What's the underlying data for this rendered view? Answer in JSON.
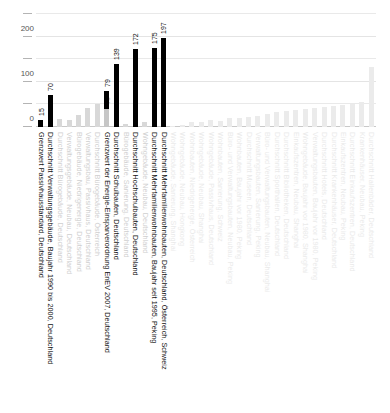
{
  "chart_data": {
    "type": "bar",
    "title": "",
    "subtitle": "",
    "xlabel": "",
    "ylabel": "",
    "ylim": [
      0,
      250
    ],
    "grid": true,
    "legend": "none",
    "y_ticks": [
      {
        "value": 0,
        "label": "0",
        "major": true
      },
      {
        "value": 50,
        "label": "",
        "major": false
      },
      {
        "value": 100,
        "label": "100",
        "major": true
      },
      {
        "value": 150,
        "label": "",
        "major": false
      },
      {
        "value": 200,
        "label": "200",
        "major": true
      },
      {
        "value": 250,
        "label": "",
        "major": false
      }
    ],
    "categories": [
      "Grenzwert Passivhausstandard, Deutschland",
      "Durchschnitt Verwaltungsgebäude, Baujahr 1990 bis 2000, Deutschland",
      "Durchschnitt Bürogebäude, Deutschland",
      "Verwaltungsgebäude, Neubau, Deutschland",
      "Bürogebäude, Niedrigenergie, Deutschland",
      "Verwaltungsbau, Passivhaus, Deutschland",
      "Durchschnitt Bürogebäude, Österreich",
      "Grenzwert der Energie-Einsparverordnung EnEV 2007, Deutschland",
      "Durchschnitt Schulbauten, Deutschland",
      "Bürogebäude, Sanierung, Deutschland",
      "Durchschnitt Hochschulbauten, Deutschland",
      "Wohngebäude, Neubau, Deutschland",
      "Durchschnitt Mehrfamilienwohnbauten, Baujahr seit 1995, Peking",
      "Durchschnitt Mehrfamilienwohnbauten, Deutschland, Österreich, Schweiz",
      "Wohngebäude, Sanierung, Shanghai",
      "Wohngebäude, Neubau, Hongkong",
      "Wohnbauten, Niedrigenergie, Österreich",
      "Wohngebäude, Neubau, Shanghai",
      "Wohngebäude, Passivhaus, Deutschland",
      "Wohnbauten, Sanierung, Schweiz",
      "Büro- und Verwaltungsbauten, Neubau, Peking",
      "Wohnbauten, Baujahr vor 1980, Peking",
      "Durchschnitt Museen, Deutschland",
      "Verwaltungsbauten, Sanierung, Peking",
      "Büro- und Verwaltungsbauten, Neubau, Shanghai",
      "Durchschnitt Sporthallen, Deutschland",
      "Durchschnitt Bibliotheken, Deutschland",
      "Einkaufszentren, Neubau, Shanghai",
      "Wohngebäude, Baujahr vor 1980, Shanghai",
      "Verwaltungsbauten, Baujahr vor 1980, Peking",
      "Durchschnitt Hotels, Deutschland",
      "Durchschnitt Krankenhäuser, Deutschland",
      "Einkaufszentren, Neubau, Peking",
      "Durchschnitt Einkaufszentren, Deutschland",
      "Krankenhäuser, Neubau, Peking",
      "Durchschnitt Hallenbäder, Deutschland"
    ],
    "values": [
      15,
      70,
      18,
      16,
      26,
      42,
      50,
      79,
      139,
      6,
      172,
      12,
      175,
      197,
      3,
      4,
      10,
      11,
      16,
      14,
      20,
      21,
      23,
      25,
      29,
      33,
      36,
      38,
      40,
      42,
      44,
      46,
      48,
      52,
      56,
      132
    ],
    "value_labels": [
      "15",
      "70",
      "",
      "",
      "",
      "",
      "",
      "79",
      "139",
      "",
      "172",
      "",
      "175",
      "197",
      "",
      "",
      "",
      "",
      "",
      "",
      "",
      "",
      "",
      "",
      "",
      "",
      "",
      "",
      "",
      "",
      "",
      "",
      "",
      "",
      "",
      ""
    ],
    "stacked_sub": [
      null,
      null,
      null,
      null,
      null,
      null,
      null,
      40,
      null,
      null,
      null,
      null,
      null,
      null,
      null,
      null,
      null,
      null,
      null,
      null,
      null,
      null,
      null,
      null,
      null,
      null,
      null,
      null,
      null,
      null,
      null,
      null,
      null,
      null,
      null,
      null
    ],
    "stacked_sub_labels": [
      "",
      "",
      "",
      "",
      "",
      "",
      "",
      "40",
      "",
      "",
      "",
      "",
      "",
      "",
      "",
      "",
      "",
      "",
      "",
      "",
      "",
      "",
      "",
      "",
      "",
      "",
      "",
      "",
      "",
      "",
      "",
      "",
      "",
      "",
      "",
      ""
    ],
    "emphasis": [
      "dark",
      "dark",
      "light",
      "light",
      "light",
      "light",
      "light",
      "dark",
      "dark",
      "light",
      "dark",
      "light",
      "dark",
      "dark",
      "faint",
      "faint",
      "faint",
      "faint",
      "faint",
      "faint",
      "faint",
      "faint",
      "faint",
      "faint",
      "faint",
      "faint",
      "faint",
      "faint",
      "faint",
      "faint",
      "faint",
      "faint",
      "faint",
      "faint",
      "faint",
      "faint"
    ],
    "label_emphasis": [
      "dark",
      "dark",
      "light",
      "light",
      "light",
      "light",
      "light",
      "dark",
      "dark",
      "light",
      "dark",
      "light",
      "dark",
      "dark",
      "faint",
      "faint",
      "faint",
      "faint",
      "faint",
      "faint",
      "faint",
      "faint",
      "faint",
      "faint",
      "faint",
      "faint",
      "faint",
      "faint",
      "faint",
      "faint",
      "faint",
      "faint",
      "faint",
      "faint",
      "faint",
      "faint"
    ]
  },
  "colors": {
    "bar_dark": "#000000",
    "bar_light": "#d8d8d8",
    "bar_faint": "#ebebeb",
    "bar_sub": "#c6c6c6",
    "grid": "#e9e9e9",
    "axis": "#c9c9c9",
    "background": "#ffffff",
    "text": "#111111"
  }
}
